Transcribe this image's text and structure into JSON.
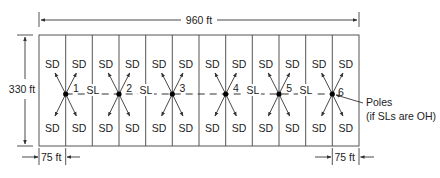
{
  "diagram": {
    "dimensions": {
      "overall_width_label": "960 ft",
      "overall_height_label": "330 ft",
      "lot_width_left_label": "75 ft",
      "lot_width_right_label": "75 ft"
    },
    "lot_count": 12,
    "lot_label": "SD",
    "span_label": "SL",
    "poles": [
      {
        "id": "1",
        "label": "1"
      },
      {
        "id": "2",
        "label": "2"
      },
      {
        "id": "3",
        "label": "3"
      },
      {
        "id": "4",
        "label": "4"
      },
      {
        "id": "5",
        "label": "5"
      },
      {
        "id": "6",
        "label": "6"
      }
    ],
    "spans": [
      {
        "from": "1",
        "to": "2",
        "label": "SL"
      },
      {
        "from": "2",
        "to": "3",
        "label": "SL"
      },
      {
        "from": "3",
        "to": "4",
        "label": ""
      },
      {
        "from": "4",
        "to": "5",
        "label": "SL"
      },
      {
        "from": "5",
        "to": "6",
        "label": "SL"
      }
    ],
    "callout": {
      "line1": "Poles",
      "line2": "(if SLs are OH)"
    },
    "colors": {
      "line": "#555555",
      "text": "#222222",
      "pole": "#000000",
      "background": "#ffffff"
    }
  }
}
